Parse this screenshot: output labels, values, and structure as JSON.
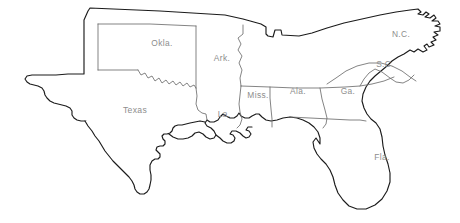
{
  "map": {
    "title": "Southern United States outline map",
    "background_color": "#ffffff",
    "coastline_color": "#1b1b1b",
    "internal_border_color": "#6e6e6e",
    "label_color": "#8d8d8d",
    "projection_note": "unlabeled region between Ark. and N.C. is Tennessee",
    "labels": [
      {
        "id": "oklahoma",
        "text": "Okla.",
        "x": 162,
        "y": 44,
        "anchor": "middle"
      },
      {
        "id": "arkansas",
        "text": "Ark.",
        "x": 222,
        "y": 59,
        "anchor": "middle"
      },
      {
        "id": "texas",
        "text": "Texas",
        "x": 135,
        "y": 111,
        "anchor": "middle"
      },
      {
        "id": "louisiana",
        "text": "La.",
        "x": 224,
        "y": 115,
        "anchor": "middle"
      },
      {
        "id": "mississippi",
        "text": "Miss.",
        "x": 262,
        "y": 96,
        "anchor": "middle"
      },
      {
        "id": "alabama",
        "text": "Ala.",
        "x": 304,
        "y": 92,
        "anchor": "middle"
      },
      {
        "id": "georgia",
        "text": "Ga.",
        "x": 353,
        "y": 92,
        "anchor": "middle"
      },
      {
        "id": "north-carolina",
        "text": "N.C.",
        "x": 401,
        "y": 35,
        "anchor": "middle"
      },
      {
        "id": "south-carolina",
        "text": "S.C.",
        "x": 385,
        "y": 65,
        "anchor": "middle"
      },
      {
        "id": "florida",
        "text": "Fla.",
        "x": 382,
        "y": 158,
        "anchor": "middle"
      }
    ],
    "outline_path": "M 84 19 L 88 12 L 226 18 L 264 26 L 268 30 L 268 37 L 274 38 L 277 31 L 282 31 L 283 35 L 300 35 L 318 29 L 340 23 L 363 19 L 385 15 L 404 11 L 419 9 L 424 12 L 427 13 L 425 17 L 431 18 L 434 15 L 437 18 L 433 21 L 439 22 L 440 25 L 436 27 L 441 28 L 441 32 L 435 33 L 439 36 L 435 39 L 438 41 L 434 43 L 437 46 L 432 48 L 430 45 L 428 48 L 431 51 L 427 54 L 423 51 L 419 54 L 415 52 L 409 56 L 403 58 L 396 62 L 392 66 L 385 70 L 378 75 L 372 80 L 368 86 L 365 93 L 364 101 L 366 108 L 369 114 L 373 118 L 378 121 L 382 126 L 384 133 L 385 141 L 386 149 L 388 157 L 391 165 L 394 173 L 395 181 L 393 190 L 389 198 L 383 205 L 375 210 L 366 213 L 357 213 L 349 210 L 343 205 L 338 199 L 335 192 L 333 185 L 330 178 L 326 172 L 321 167 L 316 163 L 311 158 L 307 152 L 304 146 L 300 141 L 295 137 L 290 134 L 284 132 L 277 131 L 270 131 L 264 131 L 258 129 L 252 127 L 246 126 L 240 126 L 234 127 L 228 129 L 222 131 L 216 132 L 211 132 L 207 130 L 205 127 L 207 124 L 212 123 L 214 120 L 212 117 L 207 117 L 203 119 L 198 122 L 195 127 L 192 132 L 187 135 L 182 137 L 176 138 L 170 139 L 164 140 L 159 139 L 155 136 L 152 133 L 149 130 L 146 127 L 141 125 L 136 124 L 130 124 L 124 123 L 118 122 L 112 121 L 107 119 L 103 116 L 100 113 L 97 112 L 94 114 L 91 117 L 88 120 L 85 122 L 81 122 L 77 120 L 73 117 L 70 114 L 66 112 L 62 111 L 58 110 L 54 108 L 50 105 L 47 101 L 45 97 L 43 93 L 40 90 L 36 88 L 32 87 L 28 86 L 25 84 L 23 81 L 25 78 L 30 77 L 36 77 L 42 77 L 48 77 L 54 77 L 60 77 L 66 77 L 72 77 L 78 77 L 83 77 L 84 70 L 84 60 L 84 50 L 84 40 L 84 30 Z",
    "texas_south_path": "M 84 122 L 88 126 L 92 131 L 96 136 L 100 141 L 103 146 L 106 151 L 110 156 L 114 160 L 118 164 L 122 168 L 126 172 L 130 176 L 133 180 L 135 184 L 136 188 L 138 191 L 141 193 L 145 193 L 148 191 L 150 188 L 151 184 L 152 179 L 152 174 L 151 169 L 151 164 L 153 160 L 156 158 L 159 158 L 161 156 L 161 153 L 159 151 L 157 149 L 158 146 L 161 145 L 164 145 L 166 143 L 166 140 L 164 138 L 163 135 L 165 133 L 168 133 L 171 132 L 173 130 L 174 127 L 176 125 L 179 124 L 183 124 L 187 123 L 191 122",
    "internal_borders": [
      {
        "id": "texas-oklahoma-panhandle-west",
        "d": "M 97 25 L 97 70"
      },
      {
        "id": "oklahoma-south-texas-line",
        "d": "M 97 25 L 196 26"
      },
      {
        "id": "oklahoma-panhandle-south",
        "d": "M 97 70 L 140 70"
      },
      {
        "id": "oklahoma-texas-red-river",
        "d": "M 140 70 L 144 74 L 148 73 L 152 77 L 156 75 L 160 79 L 164 77 L 168 81 L 172 79 L 176 82 L 180 80 L 184 83 L 188 81 L 192 84 L 196 83 L 198 86"
      },
      {
        "id": "oklahoma-arkansas-east",
        "d": "M 196 26 L 197 84"
      },
      {
        "id": "arkansas-louisiana-south",
        "d": "M 198 86 L 198 110 L 202 112 L 208 113"
      },
      {
        "id": "arkansas-mississippi-east",
        "d": "M 243 30 L 243 50 L 240 55 L 243 62 L 241 70 L 244 78 L 243 86"
      },
      {
        "id": "tennessee-south-border",
        "d": "M 243 86 L 285 88 L 322 88 L 360 86 L 390 82"
      },
      {
        "id": "louisiana-mississippi-east",
        "d": "M 243 86 L 241 96 L 240 106 L 241 116 L 240 124"
      },
      {
        "id": "mississippi-alabama-east",
        "d": "M 285 88 L 284 100 L 284 112 L 285 124 L 285 131"
      },
      {
        "id": "alabama-georgia-east",
        "d": "M 322 88 L 326 99 L 330 110 L 332 120 L 330 128 L 327 132"
      },
      {
        "id": "georgia-florida-south",
        "d": "M 298 124 L 330 124 L 355 124 L 366 122"
      },
      {
        "id": "georgia-southcarolina",
        "d": "M 360 86 L 367 74 L 374 69 L 381 72 L 390 77 L 398 80 L 405 79 L 412 74"
      },
      {
        "id": "southcarolina-northcarolina",
        "d": "M 337 83 L 348 70 L 362 62 L 375 59 L 388 60 L 399 64 L 409 70 L 418 77"
      }
    ]
  }
}
